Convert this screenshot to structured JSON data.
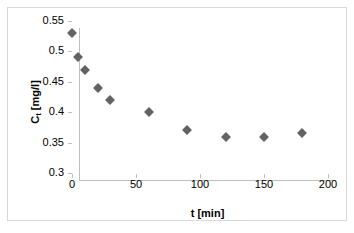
{
  "chart_data": {
    "type": "scatter",
    "title": "",
    "xlabel": "t [min]",
    "ylabel_text": "C",
    "ylabel_sub": "t",
    "ylabel_unit": " [mg/l]",
    "ylabel_full": "Ct [mg/l]",
    "xlim": [
      0,
      200
    ],
    "ylim": [
      0.3,
      0.55
    ],
    "xticks": [
      "0",
      "50",
      "100",
      "150",
      "200"
    ],
    "xtick_values": [
      0,
      50,
      100,
      150,
      200
    ],
    "yticks": [
      "0.3",
      "0.35",
      "0.4",
      "0.45",
      "0.5",
      "0.55"
    ],
    "ytick_values": [
      0.3,
      0.35,
      0.4,
      0.45,
      0.5,
      0.55
    ],
    "grid": false,
    "legend": false,
    "marker_shape": "diamond",
    "marker_color": "#636363",
    "series": [
      {
        "name": "Ct",
        "x": [
          0,
          5,
          10,
          20,
          30,
          60,
          90,
          120,
          150,
          180
        ],
        "y": [
          0.53,
          0.49,
          0.47,
          0.44,
          0.42,
          0.4,
          0.37,
          0.36,
          0.36,
          0.365
        ]
      }
    ]
  },
  "frame": {
    "border_color": "#d9d9d9",
    "axis_color": "#bfbfbf",
    "background": "#ffffff"
  }
}
